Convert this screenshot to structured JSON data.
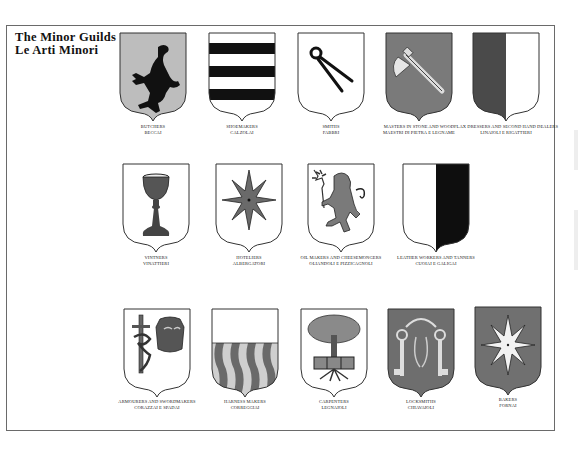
{
  "title": {
    "line1": "The Minor Guilds",
    "line2": "Le Arti Minori"
  },
  "guilds": [
    {
      "en": "Butchers",
      "it": "Beccai",
      "icon": "rampant-goat-icon",
      "field": "#bdbdbd"
    },
    {
      "en": "Shoemakers",
      "it": "Calzolai",
      "icon": "horizontal-bars-icon",
      "field": "#ffffff"
    },
    {
      "en": "Smiths",
      "it": "Fabbri",
      "icon": "pincers-icon",
      "field": "#ffffff"
    },
    {
      "en": "Masters in Stone and Wood",
      "it": "Maestri di Pietra e Legname",
      "icon": "axe-icon",
      "field": "#7a7a7a"
    },
    {
      "en": "Flax Dressers and Second Hand Dealers",
      "it": "Linaioli e Rigattieri",
      "icon": "party-per-pale-icon",
      "field": "#4a4a4a"
    },
    {
      "en": "Vintners",
      "it": "Vinattieri",
      "icon": "chalice-icon",
      "field": "#ffffff"
    },
    {
      "en": "Hoteliers",
      "it": "Albergatori",
      "icon": "eight-point-star-icon",
      "field": "#ffffff"
    },
    {
      "en": "Oil Makers and Cheesemongers",
      "it": "Oliandoli e Pizzicagnoli",
      "icon": "lion-with-olive-branch-icon",
      "field": "#ffffff"
    },
    {
      "en": "Leather Workers and Tanners",
      "it": "Cuoiai e Galigai",
      "icon": "party-per-pale-icon",
      "field": "#ffffff"
    },
    {
      "en": "Armourers and Swordmakers",
      "it": "Corazzai e Spadai",
      "icon": "sword-and-cuirass-icon",
      "field": "#ffffff"
    },
    {
      "en": "Harness Makers",
      "it": "Correggiai",
      "icon": "wavy-pales-icon",
      "field": "#ffffff"
    },
    {
      "en": "Carpenters",
      "it": "Legnaioli",
      "icon": "tree-icon",
      "field": "#ffffff"
    },
    {
      "en": "Locksmiths",
      "it": "Chiavaioli",
      "icon": "keys-icon",
      "field": "#6e6e6e"
    },
    {
      "en": "Bakers",
      "it": "Fornai",
      "icon": "white-star-icon",
      "field": "#707070"
    }
  ]
}
